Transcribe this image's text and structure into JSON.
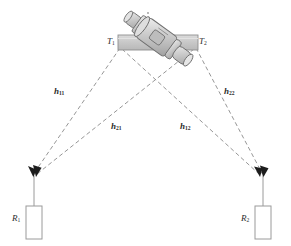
{
  "figure": {
    "type": "schematic-diagram",
    "width": 291,
    "height": 246,
    "background_color": "#ffffff",
    "line_color": "#7a7a7a",
    "text_color": "#2b2b2b",
    "machine_fill": "#d0d0d0",
    "machine_stroke": "#6e6e6e",
    "bar_fill": "#c8c8c8",
    "receiver_fill": "#ffffff",
    "receiver_stroke": "#9a9a9a"
  },
  "transmitters": [
    {
      "id": "T1",
      "name": "T",
      "sub": "1",
      "x": 118,
      "y": 44
    },
    {
      "id": "T2",
      "name": "T",
      "sub": "2",
      "x": 198,
      "y": 44
    }
  ],
  "receivers": [
    {
      "id": "R1",
      "name": "R",
      "sub": "1",
      "x": 33,
      "y": 177
    },
    {
      "id": "R2",
      "name": "R",
      "sub": "2",
      "x": 263,
      "y": 177
    }
  ],
  "channels": [
    {
      "id": "h11",
      "name": "h",
      "sub": "11",
      "from": "T1",
      "to": "R1",
      "label_x": 57,
      "label_y": 92
    },
    {
      "id": "h21",
      "name": "h",
      "sub": "21",
      "from": "T2",
      "to": "R1",
      "label_x": 114,
      "label_y": 127
    },
    {
      "id": "h12",
      "name": "h",
      "sub": "12",
      "from": "T1",
      "to": "R2",
      "label_x": 183,
      "label_y": 127
    },
    {
      "id": "h22",
      "name": "h",
      "sub": "22",
      "from": "T2",
      "to": "R2",
      "label_x": 227,
      "label_y": 92
    }
  ],
  "annotations": {
    "crossing_point": {
      "x": 156,
      "y": 88
    },
    "machine_label": "rotating-machine"
  }
}
